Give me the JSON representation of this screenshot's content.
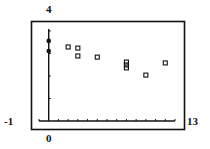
{
  "chart_data": {
    "type": "scatter",
    "title": "",
    "xlabel": "",
    "ylabel": "",
    "xlim": [
      -1,
      13
    ],
    "ylim": [
      0,
      4
    ],
    "x_tick_step": 1,
    "y_tick_step": 1,
    "grid": false,
    "window_labels": {
      "ymax": "4",
      "xmin": "-1",
      "xmax": "13",
      "origin": "0"
    },
    "series": [
      {
        "name": "filled",
        "marker": "filled-circle",
        "points": [
          {
            "x": 0,
            "y": 3.56
          },
          {
            "x": 0,
            "y": 3.11
          }
        ]
      },
      {
        "name": "boxes",
        "marker": "open-square",
        "points": [
          {
            "x": 2,
            "y": 3.29
          },
          {
            "x": 3,
            "y": 3.24
          },
          {
            "x": 3,
            "y": 2.89
          },
          {
            "x": 5,
            "y": 2.84
          },
          {
            "x": 8,
            "y": 2.62
          },
          {
            "x": 8,
            "y": 2.49
          },
          {
            "x": 8,
            "y": 2.36
          },
          {
            "x": 10,
            "y": 2.04
          },
          {
            "x": 12,
            "y": 2.58
          }
        ]
      }
    ]
  }
}
